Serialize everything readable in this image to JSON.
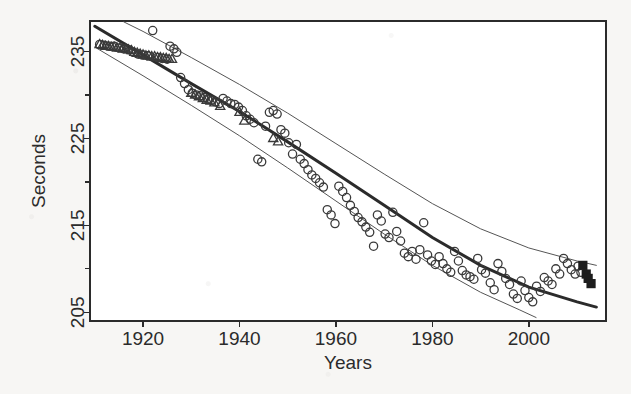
{
  "figure": {
    "background_color": "#f7f6f4",
    "ink_color": "#2b2b2b"
  },
  "axes": {
    "x_title": "Years",
    "y_title": "Seconds",
    "x_ticks": [
      "1920",
      "1940",
      "1960",
      "1980",
      "2000"
    ],
    "y_ticks": [
      "235",
      "225",
      "215",
      "205"
    ]
  },
  "chart_data": {
    "type": "scatter",
    "title": "",
    "xlabel": "Years",
    "ylabel": "Seconds",
    "xlim": [
      1909,
      2016
    ],
    "ylim": [
      204,
      238.5
    ],
    "x_ticks": [
      1920,
      1940,
      1960,
      1980,
      2000
    ],
    "y_ticks": [
      235,
      225,
      215,
      205
    ],
    "y_minor_ticks": [
      230,
      220,
      210
    ],
    "grid": false,
    "legend": "none",
    "frame": "box",
    "series": [
      {
        "name": "records-triangles",
        "marker": "open-triangle",
        "color": "#3a3a3a",
        "points": [
          [
            1911.0,
            235.8
          ],
          [
            1911.6,
            235.7
          ],
          [
            1912.2,
            235.6
          ],
          [
            1912.8,
            235.6
          ],
          [
            1913.4,
            235.5
          ],
          [
            1914.0,
            235.5
          ],
          [
            1914.6,
            235.4
          ],
          [
            1915.2,
            235.4
          ],
          [
            1915.8,
            235.3
          ],
          [
            1916.4,
            235.3
          ],
          [
            1917.0,
            235.2
          ],
          [
            1917.6,
            235.1
          ],
          [
            1918.2,
            234.9
          ],
          [
            1918.8,
            234.8
          ],
          [
            1919.4,
            234.7
          ],
          [
            1920.0,
            234.6
          ],
          [
            1920.6,
            234.5
          ],
          [
            1921.2,
            234.5
          ],
          [
            1921.8,
            234.4
          ],
          [
            1922.4,
            234.4
          ],
          [
            1923.0,
            234.3
          ],
          [
            1923.6,
            234.3
          ],
          [
            1924.2,
            234.2
          ],
          [
            1924.8,
            234.2
          ],
          [
            1925.4,
            234.1
          ],
          [
            1926.0,
            234.1
          ],
          [
            1930.0,
            230.2
          ],
          [
            1930.8,
            230.0
          ],
          [
            1931.6,
            229.8
          ],
          [
            1932.4,
            229.6
          ],
          [
            1933.2,
            229.4
          ],
          [
            1934.0,
            229.3
          ],
          [
            1934.8,
            229.1
          ],
          [
            1936.0,
            228.7
          ],
          [
            1940.0,
            228.0
          ],
          [
            1941.0,
            227.0
          ],
          [
            1947.0,
            225.0
          ],
          [
            1948.0,
            224.6
          ]
        ]
      },
      {
        "name": "records-circles",
        "marker": "open-circle",
        "color": "#3a3a3a",
        "points": [
          [
            1911.0,
            235.8
          ],
          [
            1912.0,
            235.7
          ],
          [
            1913.0,
            235.6
          ],
          [
            1914.0,
            235.6
          ],
          [
            1915.0,
            235.4
          ],
          [
            1916.0,
            235.3
          ],
          [
            1917.0,
            235.2
          ],
          [
            1918.0,
            234.9
          ],
          [
            1919.0,
            234.7
          ],
          [
            1920.0,
            234.6
          ],
          [
            1921.0,
            234.5
          ],
          [
            1922.0,
            237.4
          ],
          [
            1923.0,
            234.3
          ],
          [
            1924.0,
            234.2
          ],
          [
            1925.0,
            234.1
          ],
          [
            1925.6,
            235.6
          ],
          [
            1926.4,
            235.3
          ],
          [
            1927.0,
            234.9
          ],
          [
            1927.8,
            232.0
          ],
          [
            1928.6,
            231.3
          ],
          [
            1929.4,
            230.6
          ],
          [
            1930.2,
            230.2
          ],
          [
            1931.0,
            230.0
          ],
          [
            1931.8,
            229.9
          ],
          [
            1932.6,
            229.7
          ],
          [
            1933.4,
            229.5
          ],
          [
            1934.2,
            229.4
          ],
          [
            1935.0,
            229.2
          ],
          [
            1935.8,
            229.0
          ],
          [
            1936.6,
            229.6
          ],
          [
            1937.4,
            229.3
          ],
          [
            1938.2,
            229.0
          ],
          [
            1939.0,
            228.9
          ],
          [
            1939.8,
            228.6
          ],
          [
            1940.6,
            228.2
          ],
          [
            1941.4,
            227.6
          ],
          [
            1942.2,
            227.2
          ],
          [
            1943.0,
            226.8
          ],
          [
            1943.8,
            222.6
          ],
          [
            1944.6,
            222.3
          ],
          [
            1945.4,
            226.4
          ],
          [
            1946.2,
            228.0
          ],
          [
            1947.0,
            228.2
          ],
          [
            1947.8,
            227.8
          ],
          [
            1948.6,
            226.0
          ],
          [
            1949.4,
            225.6
          ],
          [
            1950.2,
            224.5
          ],
          [
            1951.0,
            223.2
          ],
          [
            1951.8,
            224.3
          ],
          [
            1952.6,
            222.6
          ],
          [
            1953.4,
            222.1
          ],
          [
            1954.2,
            221.4
          ],
          [
            1955.0,
            220.8
          ],
          [
            1955.8,
            220.4
          ],
          [
            1956.6,
            219.9
          ],
          [
            1957.4,
            219.4
          ],
          [
            1958.2,
            216.8
          ],
          [
            1959.0,
            216.2
          ],
          [
            1959.8,
            215.2
          ],
          [
            1960.6,
            219.5
          ],
          [
            1961.4,
            218.9
          ],
          [
            1962.2,
            218.2
          ],
          [
            1963.0,
            217.3
          ],
          [
            1963.8,
            216.6
          ],
          [
            1964.6,
            215.9
          ],
          [
            1965.4,
            215.4
          ],
          [
            1966.2,
            214.8
          ],
          [
            1967.0,
            214.2
          ],
          [
            1967.8,
            212.6
          ],
          [
            1968.6,
            216.2
          ],
          [
            1969.4,
            215.5
          ],
          [
            1970.2,
            214.0
          ],
          [
            1971.0,
            213.6
          ],
          [
            1971.8,
            216.5
          ],
          [
            1972.6,
            214.3
          ],
          [
            1973.4,
            213.2
          ],
          [
            1974.2,
            211.8
          ],
          [
            1975.0,
            211.4
          ],
          [
            1975.8,
            212.0
          ],
          [
            1976.6,
            211.1
          ],
          [
            1977.4,
            212.2
          ],
          [
            1978.2,
            215.3
          ],
          [
            1979.0,
            211.6
          ],
          [
            1979.8,
            210.9
          ],
          [
            1980.6,
            210.5
          ],
          [
            1981.4,
            211.4
          ],
          [
            1982.2,
            210.6
          ],
          [
            1983.0,
            210.0
          ],
          [
            1983.8,
            209.6
          ],
          [
            1984.6,
            212.0
          ],
          [
            1985.4,
            210.9
          ],
          [
            1986.2,
            209.8
          ],
          [
            1987.0,
            209.3
          ],
          [
            1987.8,
            209.1
          ],
          [
            1988.6,
            208.8
          ],
          [
            1989.4,
            211.2
          ],
          [
            1990.2,
            209.9
          ],
          [
            1991.0,
            209.5
          ],
          [
            1992.0,
            208.4
          ],
          [
            1992.8,
            207.6
          ],
          [
            1993.6,
            210.6
          ],
          [
            1994.4,
            209.7
          ],
          [
            1995.2,
            208.9
          ],
          [
            1996.0,
            208.2
          ],
          [
            1996.8,
            207.1
          ],
          [
            1997.6,
            206.6
          ],
          [
            1998.4,
            208.6
          ],
          [
            1999.2,
            207.5
          ],
          [
            2000.0,
            206.7
          ],
          [
            2000.8,
            206.2
          ],
          [
            2001.6,
            208.0
          ],
          [
            2002.4,
            207.4
          ],
          [
            2003.2,
            209.0
          ],
          [
            2004.0,
            208.6
          ],
          [
            2004.8,
            208.2
          ],
          [
            2005.6,
            210.0
          ],
          [
            2006.4,
            209.4
          ],
          [
            2007.2,
            211.2
          ],
          [
            2008.0,
            210.6
          ],
          [
            2008.8,
            209.9
          ],
          [
            2009.6,
            209.4
          ],
          [
            2010.2,
            210.3
          ],
          [
            2010.8,
            209.6
          ]
        ]
      },
      {
        "name": "recent-filled-squares",
        "marker": "filled-square",
        "color": "#1d1d1d",
        "points": [
          [
            2011.2,
            210.4
          ],
          [
            2011.9,
            209.4
          ],
          [
            2012.3,
            208.9
          ],
          [
            2012.9,
            208.3
          ]
        ]
      }
    ],
    "curves": [
      {
        "name": "fitted-trend",
        "style": "thick-solid",
        "color": "#2b2b2b",
        "width": 3,
        "points": [
          [
            1910.0,
            237.9
          ],
          [
            1920.0,
            234.6
          ],
          [
            1930.0,
            231.3
          ],
          [
            1940.0,
            228.1
          ],
          [
            1950.0,
            224.6
          ],
          [
            1960.0,
            221.0
          ],
          [
            1970.0,
            217.3
          ],
          [
            1980.0,
            213.6
          ],
          [
            1990.0,
            210.4
          ],
          [
            2000.0,
            207.9
          ],
          [
            2010.0,
            206.2
          ],
          [
            2014.0,
            205.6
          ]
        ]
      },
      {
        "name": "upper-confidence-band",
        "style": "thin-solid",
        "color": "#555555",
        "width": 1,
        "points": [
          [
            1916.0,
            238.4
          ],
          [
            1920.0,
            237.3
          ],
          [
            1930.0,
            234.3
          ],
          [
            1940.0,
            231.2
          ],
          [
            1950.0,
            227.9
          ],
          [
            1960.0,
            224.4
          ],
          [
            1970.0,
            220.9
          ],
          [
            1980.0,
            217.5
          ],
          [
            1990.0,
            214.6
          ],
          [
            2000.0,
            212.4
          ],
          [
            2010.0,
            210.9
          ],
          [
            2014.0,
            210.4
          ]
        ]
      },
      {
        "name": "lower-confidence-band",
        "style": "thin-solid",
        "color": "#555555",
        "width": 1,
        "points": [
          [
            1910.0,
            235.5
          ],
          [
            1920.0,
            232.2
          ],
          [
            1930.0,
            228.8
          ],
          [
            1940.0,
            225.3
          ],
          [
            1950.0,
            221.6
          ],
          [
            1960.0,
            217.8
          ],
          [
            1970.0,
            214.0
          ],
          [
            1980.0,
            210.4
          ],
          [
            1990.0,
            207.3
          ],
          [
            1998.0,
            205.3
          ],
          [
            2001.5,
            204.4
          ]
        ]
      }
    ]
  }
}
